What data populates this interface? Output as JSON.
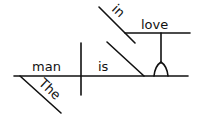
{
  "diagram": {
    "type": "sentence-diagram",
    "sentence_words": {
      "subject": "man",
      "subject_modifier": "The",
      "verb": "is",
      "preposition": "in",
      "object_of_preposition": "love"
    },
    "colors": {
      "ink": "#111111",
      "background": "#ffffff"
    }
  }
}
